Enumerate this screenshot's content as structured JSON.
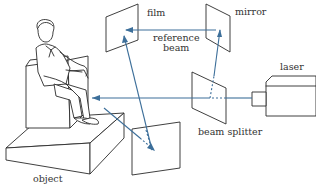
{
  "diagram": {
    "type": "holography-setup",
    "labels": {
      "film": "film",
      "mirror": "mirror",
      "reference_beam_line1": "reference",
      "reference_beam_line2": "beam",
      "laser": "laser",
      "beam_splitter": "beam splitter",
      "object": "object"
    },
    "colors": {
      "beam": "#3d6f9a",
      "ink": "#2a2a2a",
      "background": "#ffffff"
    },
    "components": [
      {
        "id": "laser",
        "label": "laser"
      },
      {
        "id": "beam-splitter",
        "label": "beam splitter"
      },
      {
        "id": "mirror",
        "label": "mirror"
      },
      {
        "id": "film",
        "label": "film"
      },
      {
        "id": "object",
        "label": "object"
      },
      {
        "id": "second-plate",
        "label": ""
      }
    ],
    "beams": [
      {
        "from": "laser",
        "to": "beam-splitter"
      },
      {
        "from": "beam-splitter",
        "to": "mirror"
      },
      {
        "from": "mirror",
        "to": "film",
        "label": "reference beam"
      },
      {
        "from": "beam-splitter",
        "to": "object"
      },
      {
        "from": "object",
        "to": "film"
      },
      {
        "from": "object",
        "to": "second-plate"
      }
    ]
  }
}
